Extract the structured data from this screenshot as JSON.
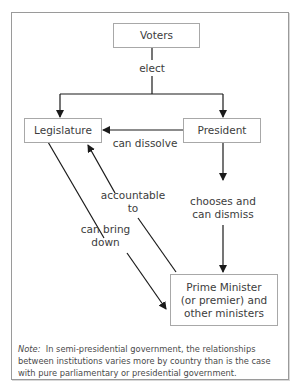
{
  "diagram": {
    "type": "flow",
    "nodes": {
      "voters": "Voters",
      "legislature": "Legislature",
      "president": "President",
      "prime_minister": [
        "Prime Minister",
        "(or premier) and",
        "other ministers"
      ]
    },
    "edges": {
      "elect": "elect",
      "can_dissolve": "can dissolve",
      "chooses": [
        "chooses and",
        "can dismiss"
      ],
      "accountable": [
        "accountable",
        "to"
      ],
      "bring_down": [
        "can bring",
        "down"
      ]
    },
    "relationships": [
      {
        "from": "Voters",
        "to": "Legislature",
        "label": "elect"
      },
      {
        "from": "Voters",
        "to": "President",
        "label": "elect"
      },
      {
        "from": "President",
        "to": "Legislature",
        "label": "can dissolve"
      },
      {
        "from": "President",
        "to": "Prime Minister (or premier) and other ministers",
        "label": "chooses and can dismiss"
      },
      {
        "from": "Prime Minister (or premier) and other ministers",
        "to": "Legislature",
        "label": "accountable to"
      },
      {
        "from": "Legislature",
        "to": "Prime Minister (or premier) and other ministers",
        "label": "can bring down"
      }
    ],
    "note_label": "Note:",
    "note_text": "In semi-presidential government, the relationships between institutions varies more by country than is the case with pure parliamentary or presidential government."
  }
}
